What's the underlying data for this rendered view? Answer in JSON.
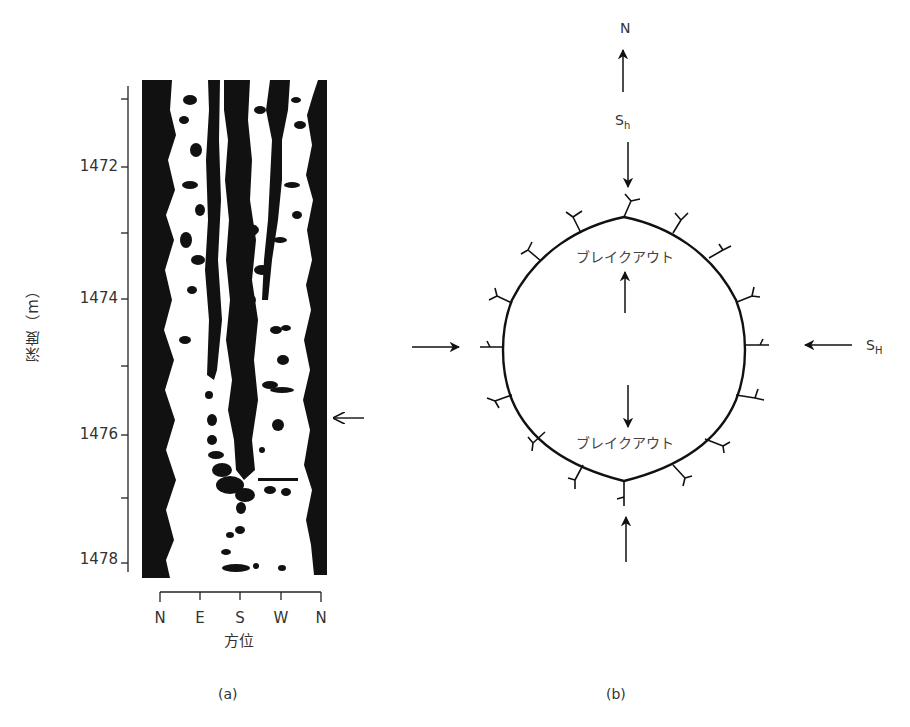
{
  "figure": {
    "panel_a": {
      "caption": "(a)",
      "y_axis": {
        "label": "深度（m）",
        "ticks": [
          "1472",
          "1474",
          "1476",
          "1478"
        ],
        "range_m": [
          1470.7,
          1478.2
        ]
      },
      "x_axis": {
        "label": "方位",
        "ticks": [
          "N",
          "E",
          "S",
          "W",
          "N"
        ]
      },
      "marker": {
        "type": "arrow-left",
        "depth_m": 1475.8,
        "description": "breakout zone indicator"
      }
    },
    "panel_b": {
      "caption": "(b)",
      "north_label": "N",
      "sh_min_label": "S",
      "sh_min_sub": "h",
      "sh_max_label": "S",
      "sh_max_sub": "H",
      "breakout_top_label": "ブレイクアウト",
      "breakout_bottom_label": "ブレイクアウト"
    }
  },
  "colors": {
    "ink": "#111111",
    "text": "#333333",
    "background": "#ffffff"
  }
}
